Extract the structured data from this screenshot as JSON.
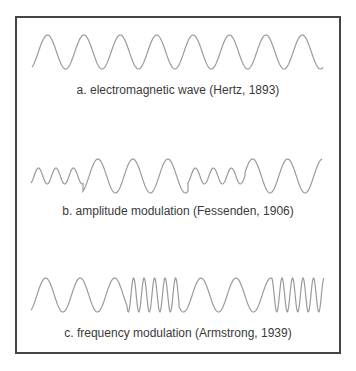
{
  "figure": {
    "stroke_color": "#9a9a9a",
    "border_color": "#444444",
    "panels": [
      {
        "id": "a",
        "caption": "a. electromagnetic wave (Hertz, 1893)",
        "caption_y": 83,
        "wave": {
          "type": "carrier",
          "x_start": 32,
          "x_end": 323,
          "center_y": 52,
          "amplitude": 17,
          "segments": [
            {
              "from": 32,
              "to": 323,
              "period": 36.4,
              "amplitude": 17
            }
          ]
        }
      },
      {
        "id": "b",
        "caption": "b. amplitude modulation (Fessenden, 1906)",
        "caption_y": 204,
        "wave": {
          "type": "amplitude-modulated",
          "x_start": 31,
          "x_end": 322,
          "center_y": 176,
          "segments": [
            {
              "from": 31,
              "to": 83,
              "period": 17.5,
              "amplitude": 8
            },
            {
              "from": 83,
              "to": 188,
              "period": 35,
              "amplitude": 17
            },
            {
              "from": 188,
              "to": 245,
              "period": 18,
              "amplitude": 8
            },
            {
              "from": 245,
              "to": 322,
              "period": 35,
              "amplitude": 17
            }
          ]
        }
      },
      {
        "id": "c",
        "caption": "c. frequency modulation (Armstrong, 1939)",
        "caption_y": 326,
        "wave": {
          "type": "frequency-modulated",
          "x_start": 31,
          "x_end": 324,
          "center_y": 295,
          "segments": [
            {
              "from": 31,
              "to": 127,
              "period": 34.5,
              "amplitude": 17
            },
            {
              "from": 127,
              "to": 179,
              "period": 10.5,
              "amplitude": 17
            },
            {
              "from": 179,
              "to": 272,
              "period": 35,
              "amplitude": 17
            },
            {
              "from": 272,
              "to": 324,
              "period": 10.5,
              "amplitude": 17
            }
          ]
        }
      }
    ]
  }
}
